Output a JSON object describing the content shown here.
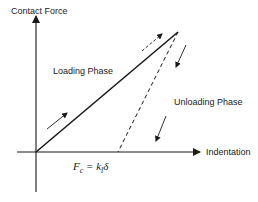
{
  "diagram": {
    "y_axis_label": "Contact Force",
    "x_axis_label": "Indentation",
    "loading_label": "Loading Phase",
    "unloading_label": "Unloading Phase",
    "equation": "F",
    "equation_sub": "c",
    "equation_rest": " = k",
    "equation_sub2": "l",
    "equation_end": "δ",
    "colors": {
      "line": "#1a1a1a",
      "background": "#ffffff"
    }
  }
}
